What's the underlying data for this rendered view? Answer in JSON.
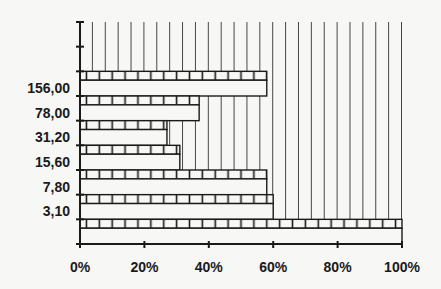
{
  "chart_data": {
    "type": "bar",
    "orientation": "horizontal",
    "stacked_percent": true,
    "title": "",
    "xlabel": "",
    "ylabel": "",
    "xlim": [
      0,
      100
    ],
    "x_ticks": [
      "0%",
      "20%",
      "40%",
      "60%",
      "80%",
      "100%"
    ],
    "x_tick_values": [
      0,
      20,
      40,
      60,
      80,
      100
    ],
    "rows": 9,
    "categories": [
      "",
      "",
      "156,00",
      "78,00",
      "31,20",
      "15,60",
      "7,80",
      "3,10",
      ""
    ],
    "series": [
      {
        "name": "bar",
        "pattern": "white-with-brick-top",
        "values": [
          0,
          0,
          58,
          37,
          27,
          31,
          58,
          60,
          100
        ]
      },
      {
        "name": "remainder",
        "pattern": "vertical-lines",
        "values": [
          100,
          100,
          42,
          63,
          73,
          69,
          42,
          40,
          0
        ]
      }
    ],
    "grid": false,
    "legend": "none",
    "colors": {
      "line": "#1a1a1a",
      "fill": "#f7f7f5"
    }
  }
}
